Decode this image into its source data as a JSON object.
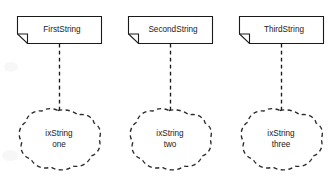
{
  "diagram": {
    "type": "uml-note-to-cloud-mapping",
    "background_color": "#ffffff",
    "line_color": "#1a1a1a",
    "columns": [
      {
        "note_label": "FirstString",
        "cloud_label_line1": "ixString",
        "cloud_label_line2": "one",
        "connector_style": "dashed"
      },
      {
        "note_label": "SecondString",
        "cloud_label_line1": "ixString",
        "cloud_label_line2": "two",
        "connector_style": "dashed"
      },
      {
        "note_label": "ThirdString",
        "cloud_label_line1": "ixString",
        "cloud_label_line2": "three",
        "connector_style": "dashed"
      }
    ]
  }
}
